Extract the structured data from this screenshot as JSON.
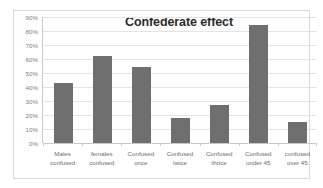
{
  "chart_data": {
    "type": "bar",
    "title": "Confederate effect",
    "xlabel": "",
    "ylabel": "",
    "categories": [
      "Males confused",
      "females confused",
      "Confused once",
      "Confused twice",
      "Confused thrice",
      "Confused under 45",
      "confused over 45"
    ],
    "values": [
      43,
      62,
      54,
      18,
      27,
      84,
      15
    ],
    "ylim": [
      0,
      90
    ],
    "ytick_labels": [
      "90%",
      "80%",
      "70%",
      "60%",
      "50%",
      "40%",
      "30%",
      "20%",
      "10%",
      "0%"
    ],
    "ytick_values": [
      90,
      80,
      70,
      60,
      50,
      40,
      30,
      20,
      10,
      0
    ],
    "grid": true,
    "legend": false,
    "series_color": "#6f6f6f",
    "gridline_color": "#e4e4e4",
    "axis_color": "#c9c9c9",
    "tick_label_color": "#808080",
    "title_color": "#2a2a2a",
    "border_color": "#d9d9d9",
    "background": "#ffffff"
  }
}
